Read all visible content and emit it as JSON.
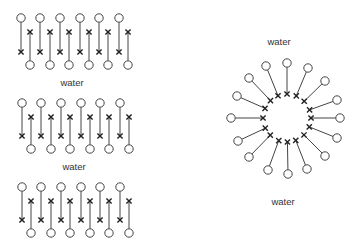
{
  "figure": {
    "width": 352,
    "height": 250,
    "background": "#ffffff",
    "stroke_color": "#444444",
    "marker_color": "#222222",
    "bilayer_stack": {
      "label_top_gap": "water",
      "label_bottom_gap": "water",
      "blocks": [
        {
          "top_head_y": 18,
          "down_tail_y": 52,
          "up_tail_y": 32,
          "bottom_head_y": 65,
          "x_offset": 0
        },
        {
          "top_head_y": 103,
          "down_tail_y": 136,
          "up_tail_y": 117,
          "bottom_head_y": 149,
          "x_offset": 1
        },
        {
          "top_head_y": 187,
          "down_tail_y": 220,
          "up_tail_y": 201,
          "bottom_head_y": 233,
          "x_offset": 1
        }
      ],
      "down_molecule_x": [
        21,
        40,
        60,
        80,
        99,
        119
      ],
      "up_molecule_x": [
        30,
        50,
        69,
        89,
        108,
        128
      ],
      "labels": [
        {
          "text": "water",
          "x": 72,
          "y": 86
        },
        {
          "text": "water",
          "x": 74,
          "y": 170
        }
      ]
    },
    "micelle": {
      "center": [
        287,
        118
      ],
      "inner_radius": 24,
      "heads": [
        [
          287,
          63
        ],
        [
          308,
          68
        ],
        [
          325,
          81
        ],
        [
          337,
          100
        ],
        [
          340,
          118
        ],
        [
          337,
          138
        ],
        [
          325,
          156
        ],
        [
          307,
          169
        ],
        [
          288,
          174
        ],
        [
          268,
          170
        ],
        [
          249,
          157
        ],
        [
          238,
          141
        ],
        [
          231,
          118
        ],
        [
          237,
          96
        ],
        [
          249,
          78
        ],
        [
          266,
          66
        ]
      ],
      "labels": [
        {
          "text": "water",
          "x": 279,
          "y": 45
        },
        {
          "text": "water",
          "x": 283,
          "y": 205
        }
      ]
    },
    "head_radius": 4.2,
    "x_marker_size": 2.6
  }
}
